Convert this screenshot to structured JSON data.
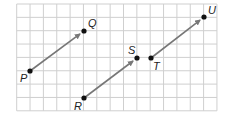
{
  "grid": {
    "x0": 16.7,
    "y0": 4,
    "cell": 13.35,
    "cols": 15,
    "rows": 8,
    "line_color": "#cfcfcf",
    "border_color": "#d6d6d6"
  },
  "vector_color": "#777777",
  "point_color": "#111111",
  "points": [
    {
      "id": "P",
      "label": "P",
      "x": 30,
      "y": 71,
      "lx": 20,
      "ly": 82
    },
    {
      "id": "Q",
      "label": "Q",
      "x": 84,
      "y": 31,
      "lx": 88,
      "ly": 27
    },
    {
      "id": "R",
      "label": "R",
      "x": 84,
      "y": 98,
      "lx": 74,
      "ly": 110
    },
    {
      "id": "S",
      "label": "S",
      "x": 137,
      "y": 58,
      "lx": 128,
      "ly": 54
    },
    {
      "id": "T",
      "label": "T",
      "x": 151,
      "y": 58,
      "lx": 153,
      "ly": 70
    },
    {
      "id": "U",
      "label": "U",
      "x": 204,
      "y": 17,
      "lx": 208,
      "ly": 14
    }
  ],
  "vectors": [
    {
      "name": "vector-PQ",
      "from": "P",
      "to": "Q"
    },
    {
      "name": "vector-RS",
      "from": "R",
      "to": "S"
    },
    {
      "name": "vector-TU",
      "from": "T",
      "to": "U"
    }
  ]
}
